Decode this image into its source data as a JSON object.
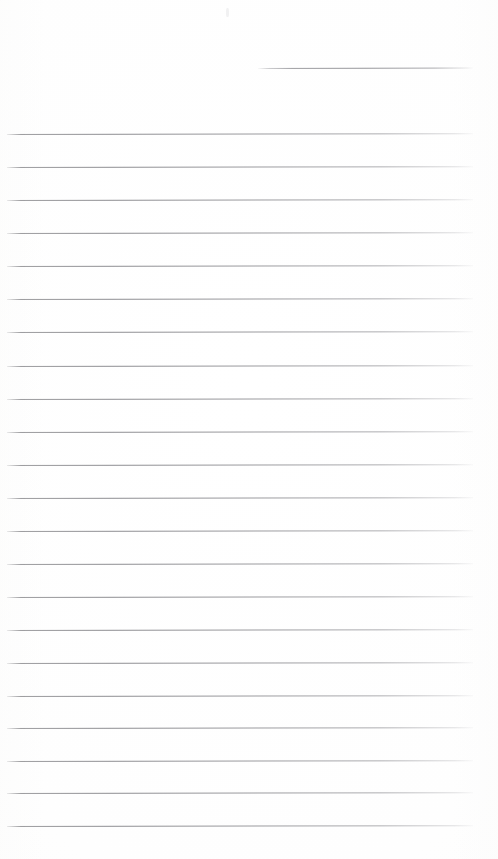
{
  "document": {
    "type": "scanned-lined-paper",
    "title": "Blank lined notepad page",
    "text_content": "",
    "page_width": 498,
    "page_height": 859,
    "background_color": "#ffffff",
    "rule_color": "#969699",
    "rule_thickness_px": 1,
    "rule_spacing_px": 32.6,
    "rule_count_total": 23,
    "rule_count_full_width": 22,
    "rule_count_short": 1,
    "scan_tilt_degrees": -0.105,
    "margin_left_px": 7,
    "margin_right_px": 473
  },
  "rules": [
    {
      "name": "heading-rule",
      "y": 68,
      "x1": 258,
      "x2": 473,
      "short": true
    },
    {
      "name": "body-rule-1",
      "y": 134,
      "x1": 7,
      "x2": 473,
      "short": false
    },
    {
      "name": "body-rule-2",
      "y": 167,
      "x1": 7,
      "x2": 473,
      "short": false
    },
    {
      "name": "body-rule-3",
      "y": 200,
      "x1": 7,
      "x2": 473,
      "short": false
    },
    {
      "name": "body-rule-4",
      "y": 233,
      "x1": 7,
      "x2": 473,
      "short": false
    },
    {
      "name": "body-rule-5",
      "y": 266,
      "x1": 7,
      "x2": 473,
      "short": false
    },
    {
      "name": "body-rule-6",
      "y": 299,
      "x1": 7,
      "x2": 473,
      "short": false
    },
    {
      "name": "body-rule-7",
      "y": 332,
      "x1": 7,
      "x2": 473,
      "short": false
    },
    {
      "name": "body-rule-8",
      "y": 366,
      "x1": 7,
      "x2": 473,
      "short": false
    },
    {
      "name": "body-rule-9",
      "y": 399,
      "x1": 7,
      "x2": 473,
      "short": false
    },
    {
      "name": "body-rule-10",
      "y": 432,
      "x1": 7,
      "x2": 473,
      "short": false
    },
    {
      "name": "body-rule-11",
      "y": 465,
      "x1": 7,
      "x2": 473,
      "short": false
    },
    {
      "name": "body-rule-12",
      "y": 498,
      "x1": 7,
      "x2": 473,
      "short": false
    },
    {
      "name": "body-rule-13",
      "y": 531,
      "x1": 7,
      "x2": 473,
      "short": false
    },
    {
      "name": "body-rule-14",
      "y": 564,
      "x1": 7,
      "x2": 473,
      "short": false
    },
    {
      "name": "body-rule-15",
      "y": 597,
      "x1": 7,
      "x2": 473,
      "short": false
    },
    {
      "name": "body-rule-16",
      "y": 630,
      "x1": 7,
      "x2": 473,
      "short": false
    },
    {
      "name": "body-rule-17",
      "y": 663,
      "x1": 7,
      "x2": 473,
      "short": false
    },
    {
      "name": "body-rule-18",
      "y": 696,
      "x1": 7,
      "x2": 473,
      "short": false
    },
    {
      "name": "body-rule-19",
      "y": 728,
      "x1": 7,
      "x2": 473,
      "short": false
    },
    {
      "name": "body-rule-20",
      "y": 761,
      "x1": 7,
      "x2": 473,
      "short": false
    },
    {
      "name": "body-rule-21",
      "y": 793,
      "x1": 7,
      "x2": 473,
      "short": false
    },
    {
      "name": "body-rule-22",
      "y": 826,
      "x1": 7,
      "x2": 473,
      "short": false
    }
  ],
  "artifacts": [
    {
      "name": "dust-speck",
      "x": 226,
      "y": 8,
      "w": 3,
      "h": 9
    }
  ]
}
